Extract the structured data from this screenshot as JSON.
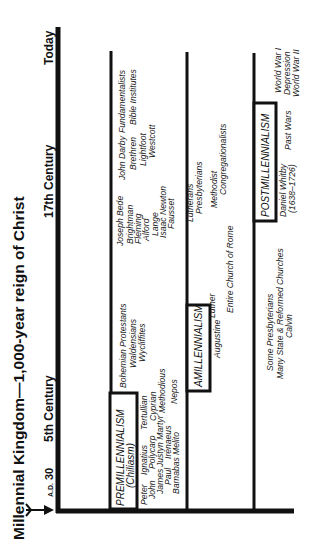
{
  "title": "Millennial Kingdom—1,000-year reign of Christ",
  "timeline": {
    "start_prefix": "A.D.",
    "start_year": "30",
    "markers": [
      "5th Century",
      "17th Century",
      "Today"
    ]
  },
  "schools": {
    "premillennialism": {
      "label": "PREMILLENNIALISM",
      "sublabel": "(Chiliasm)",
      "names": [
        "Peter",
        "John",
        "James",
        "Paul",
        "Barnabas",
        "Ignatius",
        "Polycarp",
        "Justyn Martyr",
        "Irenaeus",
        "Melito",
        "Tertullian",
        "Cyprian",
        "Methodious",
        "Nepos",
        "Bohemian Protestants",
        "Waldensians",
        "Wycliffites",
        "Joseph Bede",
        "Brightman",
        "Fleming",
        "Alford",
        "Lange",
        "Isaac Newton",
        "Fausset",
        "John Darby",
        "Brethren",
        "Lightfoot",
        "Westcott",
        "Fundamentalists",
        "Bible Institutes"
      ]
    },
    "amillennialism": {
      "label": "AMILLENNIALISM",
      "names": [
        "Augustine",
        "Luther",
        "Entire Church of Rome",
        "Lutherans",
        "Presbyterians",
        "Methodist",
        "Congregationalists"
      ]
    },
    "postmillennialism": {
      "label": "POSTMILLENNIALISM",
      "names": [
        "Some Presbyterians",
        "Many State & Reformed Churches",
        "Calvin",
        "Daniel Whitby",
        "(1638–1726)",
        "Past Wars",
        "World War I",
        "Depression",
        "World War II"
      ]
    }
  },
  "colors": {
    "line": "#111111",
    "text": "#111111",
    "background": "#ffffff"
  }
}
